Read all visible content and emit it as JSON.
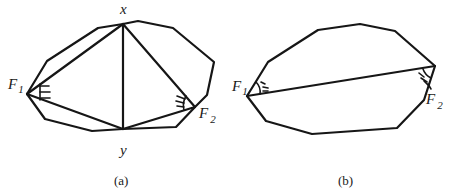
{
  "figure": {
    "panels": [
      {
        "id": "a",
        "caption": "(a)",
        "polygon": [
          [
            27,
            94
          ],
          [
            47,
            61
          ],
          [
            98,
            28
          ],
          [
            123,
            24
          ],
          [
            138,
            21
          ],
          [
            173,
            28
          ],
          [
            214,
            62
          ],
          [
            207,
            95
          ],
          [
            195,
            107
          ],
          [
            176,
            127
          ],
          [
            123,
            129
          ],
          [
            92,
            131
          ],
          [
            45,
            119
          ]
        ],
        "chords": [
          [
            [
              27,
              94
            ],
            [
              123,
              24
            ]
          ],
          [
            [
              123,
              24
            ],
            [
              123,
              129
            ]
          ],
          [
            [
              123,
              24
            ],
            [
              195,
              107
            ]
          ],
          [
            [
              27,
              94
            ],
            [
              123,
              129
            ]
          ],
          [
            [
              123,
              129
            ],
            [
              195,
              107
            ]
          ]
        ],
        "labels": {
          "x": {
            "text": "x",
            "pos": [
              121,
              14
            ]
          },
          "y": {
            "text": "y",
            "pos": [
              120,
              155
            ]
          },
          "F1": {
            "text": "F",
            "sub": "1",
            "pos": [
              10,
              88
            ]
          },
          "F2": {
            "text": "F",
            "sub": "2",
            "pos": [
              199,
              118
            ]
          }
        }
      },
      {
        "id": "b",
        "caption": "(b)",
        "polygon": [
          [
            247,
            96
          ],
          [
            268,
            62
          ],
          [
            318,
            30
          ],
          [
            360,
            24
          ],
          [
            395,
            31
          ],
          [
            435,
            66
          ],
          [
            424,
            100
          ],
          [
            397,
            128
          ],
          [
            312,
            134
          ],
          [
            266,
            121
          ]
        ],
        "chords": [
          [
            [
              247,
              96
            ],
            [
              435,
              66
            ]
          ]
        ],
        "labels": {
          "F1": {
            "text": "F",
            "sub": "1",
            "pos": [
              233,
              91
            ]
          },
          "F2": {
            "text": "F",
            "sub": "2",
            "pos": [
              425,
              106
            ]
          }
        }
      }
    ],
    "stroke_color": "#161616",
    "background": "#ffffff"
  }
}
